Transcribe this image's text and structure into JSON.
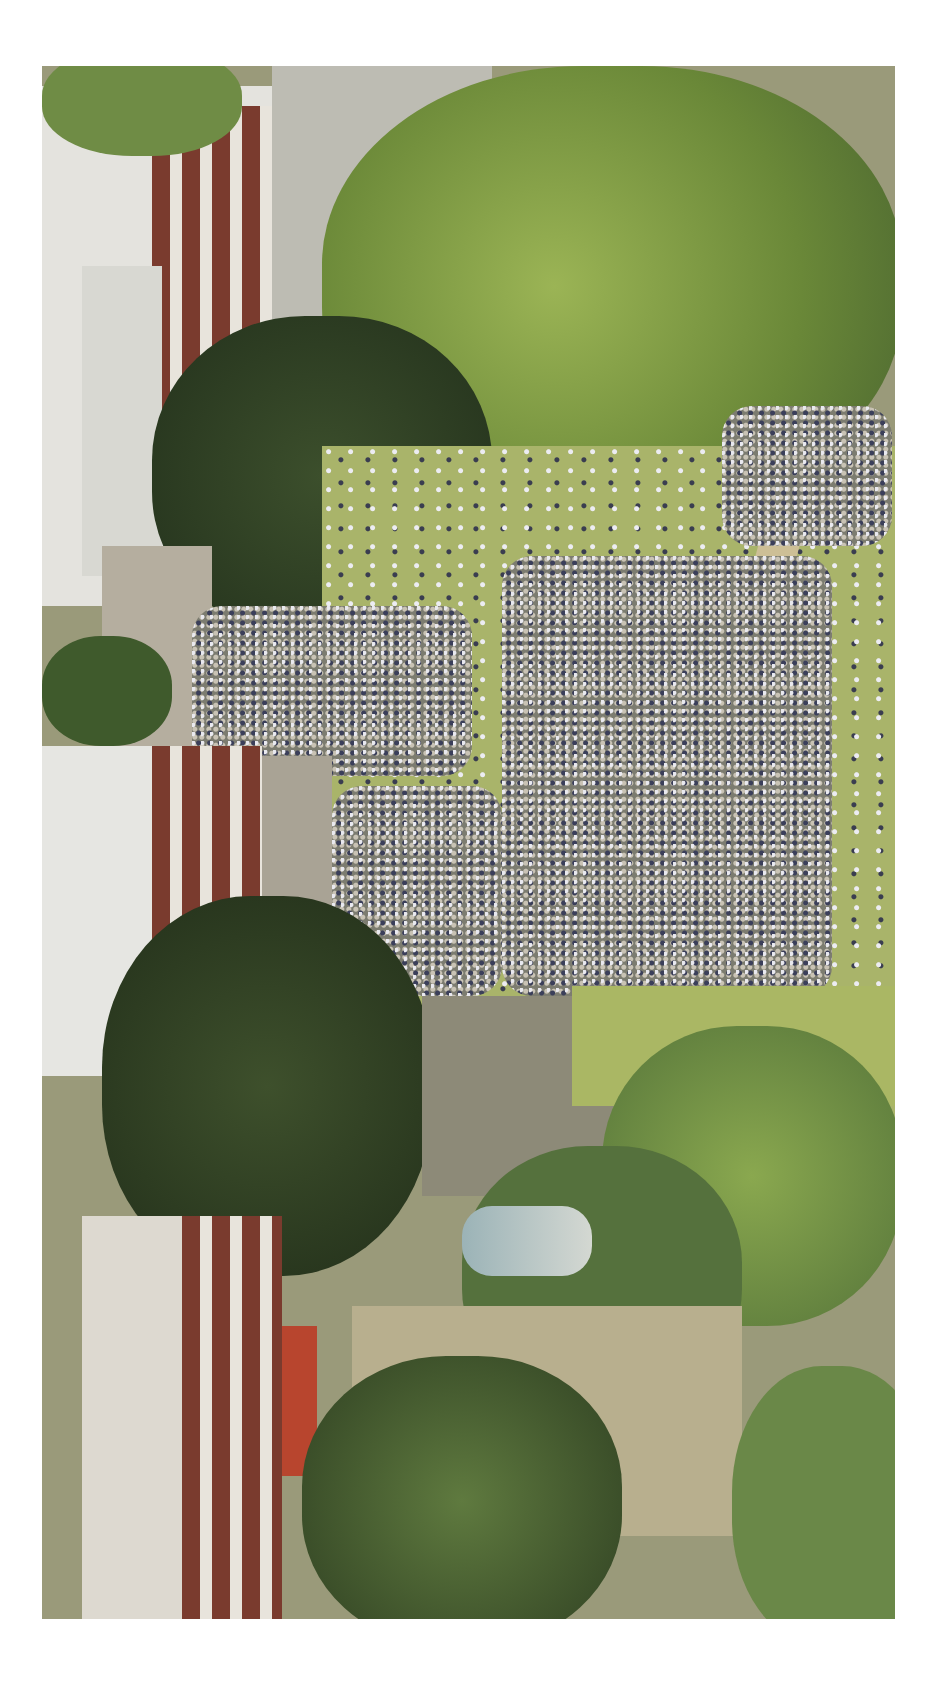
{
  "image": {
    "description": "Aerial view, rotated, of a large crowd gathered on a grassy park lawn surrounded by trees, brick buildings with white roofs, a street, and a statue on a pedestal",
    "frame": {
      "left": 42,
      "top": 66,
      "width": 853,
      "height": 1553
    },
    "background_color": "#ffffff",
    "colors": {
      "tree_light": "#8fa84a",
      "tree_dark": "#2f3d24",
      "lawn": "#a9b46a",
      "brick": "#7a3b2e",
      "roof": "#e6e6e2",
      "road": "#b9b8b0",
      "statue": "#8fa6aa",
      "path": "#c8bb94"
    },
    "regions": [
      {
        "name": "buildings-left",
        "label": "Brick buildings with white roofs"
      },
      {
        "name": "trees",
        "label": "Large tree canopies"
      },
      {
        "name": "crowd",
        "label": "Dense crowd of people"
      },
      {
        "name": "lawn",
        "label": "Grass lawn with paths"
      },
      {
        "name": "statue",
        "label": "Statue on pedestal"
      },
      {
        "name": "street",
        "label": "Street"
      }
    ]
  }
}
